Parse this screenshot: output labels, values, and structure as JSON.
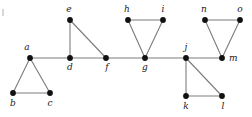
{
  "figure": {
    "width": 252,
    "height": 117,
    "background_color": "#ffffff",
    "edge_color": "#7c7c7c",
    "vertex_color": "#111111",
    "label_color": "#1a1a1a",
    "vertex_radius": 2.9,
    "edge_width": 1.1
  },
  "graph_data": {
    "type": "node-link-diagram",
    "directed": false,
    "weighted": false,
    "vertex_count": 15,
    "edge_count": 19,
    "vertices": [
      {
        "id": "a",
        "label": "a",
        "x": 30,
        "y": 58,
        "label_x": 27,
        "label_y": 50,
        "label_anchor": "middle"
      },
      {
        "id": "b",
        "label": "b",
        "x": 13,
        "y": 93,
        "label_x": 13,
        "label_y": 106,
        "label_anchor": "middle"
      },
      {
        "id": "c",
        "label": "c",
        "x": 50,
        "y": 93,
        "label_x": 50,
        "label_y": 106,
        "label_anchor": "middle"
      },
      {
        "id": "d",
        "label": "d",
        "x": 70,
        "y": 58,
        "label_x": 70,
        "label_y": 70,
        "label_anchor": "middle"
      },
      {
        "id": "e",
        "label": "e",
        "x": 70,
        "y": 20,
        "label_x": 69,
        "label_y": 12,
        "label_anchor": "middle"
      },
      {
        "id": "f",
        "label": "f",
        "x": 106,
        "y": 58,
        "label_x": 107,
        "label_y": 70,
        "label_anchor": "middle"
      },
      {
        "id": "g",
        "label": "g",
        "x": 145,
        "y": 58,
        "label_x": 145,
        "label_y": 70,
        "label_anchor": "middle"
      },
      {
        "id": "h",
        "label": "h",
        "x": 128,
        "y": 20,
        "label_x": 127,
        "label_y": 12,
        "label_anchor": "middle"
      },
      {
        "id": "i",
        "label": "i",
        "x": 163,
        "y": 20,
        "label_x": 163,
        "label_y": 12,
        "label_anchor": "middle"
      },
      {
        "id": "j",
        "label": "j",
        "x": 186,
        "y": 58,
        "label_x": 186,
        "label_y": 50,
        "label_anchor": "middle"
      },
      {
        "id": "k",
        "label": "k",
        "x": 186,
        "y": 96,
        "label_x": 186,
        "label_y": 109,
        "label_anchor": "middle"
      },
      {
        "id": "l",
        "label": "l",
        "x": 222,
        "y": 96,
        "label_x": 223,
        "label_y": 109,
        "label_anchor": "middle"
      },
      {
        "id": "m",
        "label": "m",
        "x": 222,
        "y": 58,
        "label_x": 229,
        "label_y": 61,
        "label_anchor": "start"
      },
      {
        "id": "n",
        "label": "n",
        "x": 205,
        "y": 20,
        "label_x": 204,
        "label_y": 12,
        "label_anchor": "middle"
      },
      {
        "id": "o",
        "label": "o",
        "x": 240,
        "y": 20,
        "label_x": 240,
        "label_y": 12,
        "label_anchor": "middle"
      }
    ],
    "edges": [
      {
        "source": "a",
        "target": "b"
      },
      {
        "source": "a",
        "target": "c"
      },
      {
        "source": "b",
        "target": "c"
      },
      {
        "source": "a",
        "target": "d"
      },
      {
        "source": "d",
        "target": "e"
      },
      {
        "source": "e",
        "target": "f"
      },
      {
        "source": "d",
        "target": "f"
      },
      {
        "source": "f",
        "target": "g"
      },
      {
        "source": "g",
        "target": "h"
      },
      {
        "source": "g",
        "target": "i"
      },
      {
        "source": "h",
        "target": "i"
      },
      {
        "source": "g",
        "target": "j"
      },
      {
        "source": "j",
        "target": "k"
      },
      {
        "source": "j",
        "target": "l"
      },
      {
        "source": "k",
        "target": "l"
      },
      {
        "source": "j",
        "target": "m"
      },
      {
        "source": "m",
        "target": "n"
      },
      {
        "source": "m",
        "target": "o"
      },
      {
        "source": "n",
        "target": "o"
      }
    ]
  }
}
